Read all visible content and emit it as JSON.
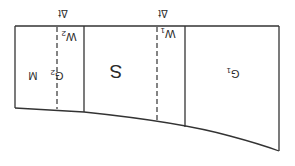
{
  "diagram": {
    "orientation": "rotated-180",
    "stroke_color": "#333333",
    "background": "#ffffff",
    "regions": [
      {
        "id": "G1",
        "label": "G",
        "subscript": "1"
      },
      {
        "id": "S",
        "label": "S"
      },
      {
        "id": "M",
        "label": "M"
      },
      {
        "id": "G2",
        "label": "G",
        "subscript": "2"
      }
    ],
    "markers": [
      {
        "id": "W1",
        "label": "W",
        "subscript": "1",
        "delta_label": "Δt"
      },
      {
        "id": "W2",
        "label": "W",
        "subscript": "2",
        "delta_label": "Δt"
      }
    ]
  }
}
